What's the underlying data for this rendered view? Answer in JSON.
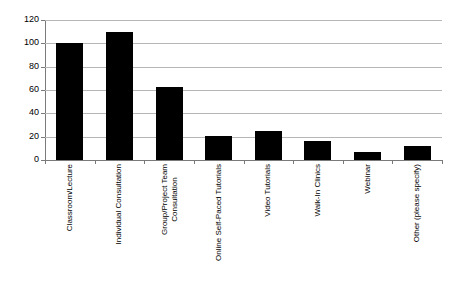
{
  "chart_data": {
    "type": "bar",
    "title": "",
    "subtitle": "",
    "xlabel": "",
    "ylabel": "",
    "ylim": [
      0,
      120
    ],
    "yticks": [
      0,
      20,
      40,
      60,
      80,
      100,
      120
    ],
    "ytick_labels": [
      "0",
      "20",
      "40",
      "60",
      "80",
      "100",
      "120"
    ],
    "grid": true,
    "legend": false,
    "legend_position": "none",
    "bar_color": "#000000",
    "gridline_color": "#b6b6b6",
    "axis_color": "#7a7a7a",
    "background_color": "#ffffff",
    "categories": [
      "Classroom/Lecture",
      "Individual Consultation",
      "Group/Project Team Consultation",
      "Online Self-Paced Tutorials",
      "Video Tutorials",
      "Walk-In Clinics",
      "Webinar",
      "Other (please specify)"
    ],
    "category_lines": [
      [
        "Classroom/Lecture"
      ],
      [
        "Individual Consultation"
      ],
      [
        "Group/Project Team",
        "Consultation"
      ],
      [
        "Online Self-Paced Tutorials"
      ],
      [
        "Video Tutorials"
      ],
      [
        "Walk-In Clinics"
      ],
      [
        "Webinar"
      ],
      [
        "Other (please specify)"
      ]
    ],
    "values": [
      100,
      110,
      63,
      21,
      25,
      16,
      7,
      12
    ]
  }
}
